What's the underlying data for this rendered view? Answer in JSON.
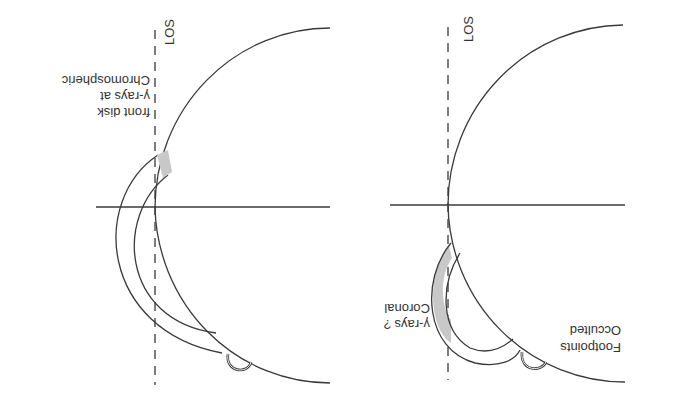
{
  "figure": {
    "orientation": "rotated-180",
    "stroke_color": "#3a3a3a",
    "shade_color": "#c8c8c8",
    "panels": [
      {
        "id": "left",
        "los_label": "LOS",
        "label_lines": [
          "Chromospheric",
          "γ-rays at",
          "front disk"
        ]
      },
      {
        "id": "right",
        "los_label": "LOS",
        "label_lines": [
          "Coronal",
          "γ-rays ?"
        ],
        "label2_lines": [
          "Occulted",
          "Footpoints"
        ]
      }
    ]
  }
}
